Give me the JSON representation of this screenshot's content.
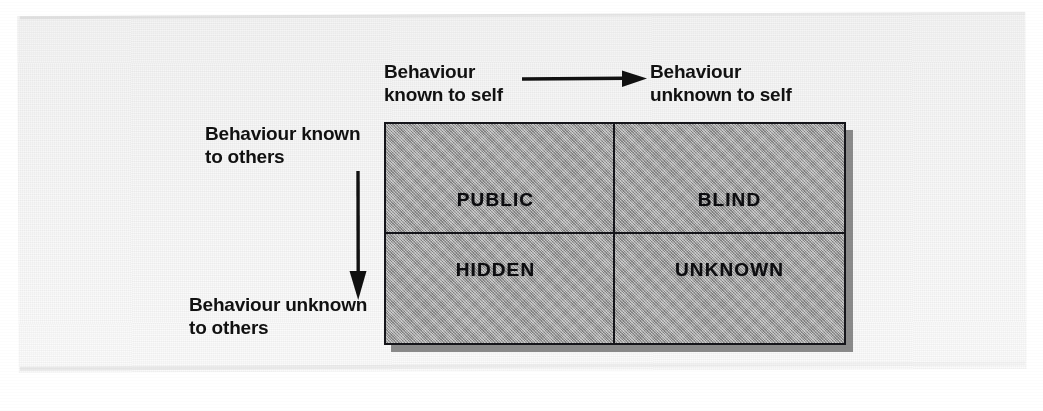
{
  "diagram": {
    "axes": {
      "top_left_label": "Behaviour\nknown to self",
      "top_right_label": "Behaviour\nunknown to self",
      "side_top_label": "Behaviour known\nto others",
      "side_bottom_label": "Behaviour unknown\nto others",
      "horizontal_arrow": "arrow-right-icon",
      "vertical_arrow": "arrow-down-icon"
    },
    "quadrants": [
      {
        "id": "public",
        "label": "PUBLIC",
        "row": "top",
        "column": "left"
      },
      {
        "id": "blind",
        "label": "BLIND",
        "row": "top",
        "column": "right"
      },
      {
        "id": "hidden",
        "label": "HIDDEN",
        "row": "bottom",
        "column": "left"
      },
      {
        "id": "unknown",
        "label": "UNKNOWN",
        "row": "bottom",
        "column": "right"
      }
    ],
    "colors": {
      "quadrant_fill": "#a9a9a9",
      "border": "#15151a",
      "shadow": "#8a8a8a",
      "text": "#111111",
      "paper": "#f7f7f7"
    }
  }
}
